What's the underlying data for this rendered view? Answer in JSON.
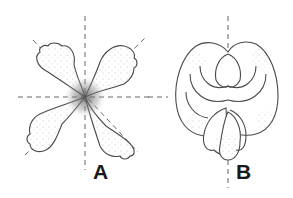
{
  "figure": {
    "panels": [
      {
        "id": "A",
        "label": "A",
        "subject": "radially symmetric four-petaled flower",
        "symmetry_axes": [
          "vertical",
          "horizontal",
          "diagonal",
          "diagonal"
        ]
      },
      {
        "id": "B",
        "label": "B",
        "subject": "bilaterally symmetric flower (front view)",
        "symmetry_axes": [
          "vertical"
        ]
      }
    ],
    "colors": {
      "line": "#4a4a4a",
      "stipple": "#6a6a6a",
      "background": "#ffffff",
      "label": "#1a1a1a"
    }
  }
}
